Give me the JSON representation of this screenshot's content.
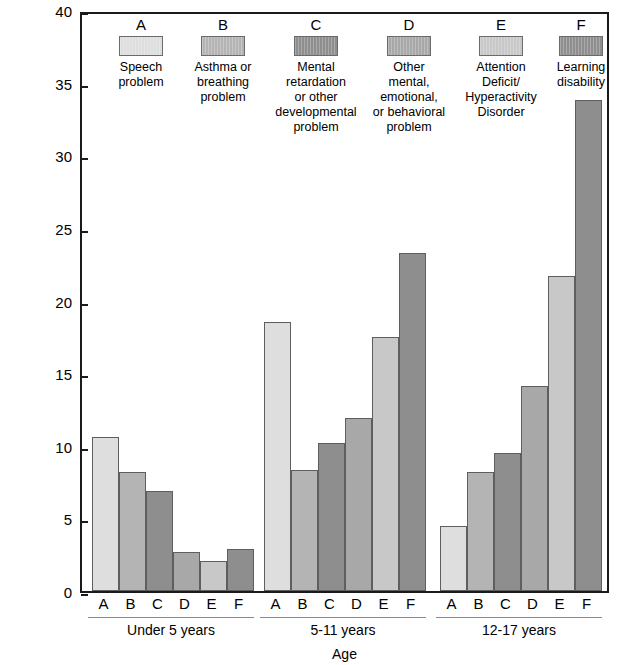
{
  "chart_data": {
    "type": "bar",
    "title": "",
    "xlabel": "Age",
    "ylabel": "Number of children with limitation of activity caused by selected chronic health conditions per 1,000 population",
    "ylim": [
      0,
      40
    ],
    "yticks": [
      0,
      5,
      10,
      15,
      20,
      25,
      30,
      35,
      40
    ],
    "grid": false,
    "legend_position": "top-inside",
    "categories": [
      "Under 5 years",
      "5-11 years",
      "12-17 years"
    ],
    "subcategories": [
      "A",
      "B",
      "C",
      "D",
      "E",
      "F"
    ],
    "series": [
      {
        "name": "A",
        "label": "Speech problem",
        "color": "#dedede",
        "values": [
          10.6,
          18.5,
          4.5
        ]
      },
      {
        "name": "B",
        "label": "Asthma or breathing problem",
        "color": "#b4b4b4",
        "values": [
          8.2,
          8.3,
          8.2
        ]
      },
      {
        "name": "C",
        "label": "Mental retardation or other developmental problem",
        "color": "#8e8e8e",
        "values": [
          6.9,
          10.2,
          9.5
        ]
      },
      {
        "name": "D",
        "label": "Other mental, emotional, or behavioral problem",
        "color": "#a8a8a8",
        "values": [
          2.7,
          11.9,
          14.1
        ]
      },
      {
        "name": "E",
        "label": "Attention Deficit/Hyperactivity Disorder",
        "color": "#c8c8c8",
        "values": [
          2.1,
          17.5,
          21.7
        ]
      },
      {
        "name": "F",
        "label": "Learning disability",
        "color": "#8e8e8e",
        "values": [
          2.9,
          23.3,
          33.8
        ]
      }
    ]
  },
  "legend": {
    "items": [
      {
        "letter": "A",
        "text": "Speech\nproblem",
        "color": "#dedede"
      },
      {
        "letter": "B",
        "text": "Asthma or\nbreathing\nproblem",
        "color": "#b4b4b4"
      },
      {
        "letter": "C",
        "text": "Mental\nretardation\nor other\ndevelopmental\nproblem",
        "color": "#8e8e8e"
      },
      {
        "letter": "D",
        "text": "Other\nmental,\nemotional,\nor behavioral\nproblem",
        "color": "#a8a8a8"
      },
      {
        "letter": "E",
        "text": "Attention\nDeficit/\nHyperactivity\nDisorder",
        "color": "#c8c8c8"
      },
      {
        "letter": "F",
        "text": "Learning\ndisability",
        "color": "#8e8e8e"
      }
    ]
  },
  "axes": {
    "y_title": "Number of children with limitation of activity caused by selected chronic health\nconditions per 1,000 population",
    "y_tick_labels": [
      "0",
      "5",
      "10",
      "15",
      "20",
      "25",
      "30",
      "35",
      "40"
    ],
    "x_title": "Age",
    "group_labels": [
      "Under 5 years",
      "5-11 years",
      "12-17 years"
    ],
    "bar_letters": [
      "A",
      "B",
      "C",
      "D",
      "E",
      "F"
    ]
  }
}
